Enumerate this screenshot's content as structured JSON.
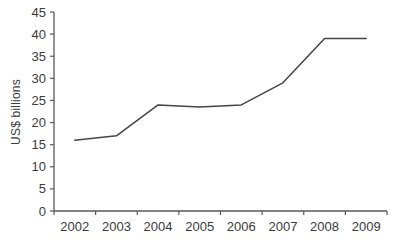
{
  "chart_data": {
    "type": "line",
    "categories": [
      "2002",
      "2003",
      "2004",
      "2005",
      "2006",
      "2007",
      "2008",
      "2009"
    ],
    "values": [
      16,
      17,
      24,
      23.5,
      24,
      29,
      39,
      39
    ],
    "title": "",
    "xlabel": "",
    "ylabel": "US$ billions",
    "ylim": [
      0,
      45
    ],
    "ytick_step": 5,
    "grid": false,
    "legend": "none",
    "line_color": "#454545",
    "axis_color": "#595959",
    "text_color": "#3a3a3a",
    "background": "#ffffff"
  }
}
